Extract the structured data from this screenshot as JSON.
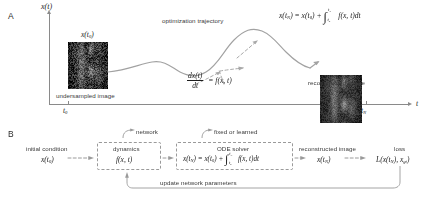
{
  "figure": {
    "panels": [
      {
        "letter": "A"
      },
      {
        "letter": "B"
      }
    ]
  },
  "panel_a": {
    "letter": "A",
    "y_axis_label": "x(t)",
    "x_axis_label": "t",
    "tick_start_label": "t0",
    "tick_end_label": "tN",
    "start_image_label": "x(t0)",
    "start_image_caption": "undersampled image",
    "trajectory_label": "optimization trajectory",
    "ode_equation": "dx(t)/dt = f(x, t)",
    "ode_numerator": "dx(t)",
    "ode_denominator": "dt",
    "ode_rhs": "= f(x, t)",
    "integral_equation": "x(tN) = x(t0) + ∫ f(x, t)dt",
    "result_image_caption": "reconstructed image"
  },
  "panel_b": {
    "letter": "B",
    "nodes": [
      {
        "name": "initial-condition",
        "caption": "initial condition",
        "value": "x(t0)"
      },
      {
        "name": "dynamics",
        "caption": "dynamics",
        "value": "f(x, t)",
        "annotation": "network"
      },
      {
        "name": "ode-solver",
        "caption": "ODE solver",
        "value": "x(tN) = x(t0) + ∫ f(x, t)dt",
        "annotation": "fixed or learned"
      },
      {
        "name": "reconstructed-image",
        "caption": "reconstructed image",
        "value": "x(tN)"
      },
      {
        "name": "loss",
        "caption": "loss",
        "value": "L(x(tN), xgt)"
      }
    ],
    "feedback_label": "update network parameters"
  },
  "colors": {
    "axis": "#8a8a8a",
    "trajectory": "#9b9b9b",
    "dashed_box": "#9a9a9a",
    "text": "#3a3a3a",
    "math_text": "#1d1d1d"
  }
}
